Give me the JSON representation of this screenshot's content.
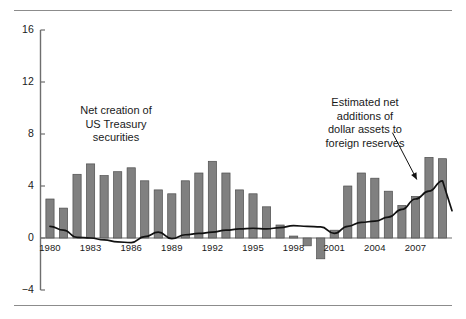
{
  "figure": {
    "background": "#ffffff",
    "rule_color": "#8c8c8c",
    "bar_color": "#808080",
    "bar_edge_color": "#4d4d4d",
    "line_color": "#111111",
    "axis_color": "#6e6e6e"
  },
  "annotations": {
    "left_label": "Net creation of\nUS Treasury\nsecurities",
    "right_label": "Estimated net\nadditions of\ndollar assets to\nforeign reserves"
  },
  "chart_data": {
    "type": "bar",
    "title": "",
    "subtitle": "",
    "xlabel": "",
    "ylabel": "",
    "xlim": [
      1979.3,
      2009.7
    ],
    "ylim": [
      -4,
      16
    ],
    "yticks": [
      -4,
      0,
      4,
      8,
      12,
      16
    ],
    "ytick_labels": [
      "−4",
      "0",
      "4",
      "8",
      "12",
      "16"
    ],
    "grid": false,
    "legend_position": "none",
    "x": [
      1980,
      1981,
      1982,
      1983,
      1984,
      1985,
      1986,
      1987,
      1988,
      1989,
      1990,
      1991,
      1992,
      1993,
      1994,
      1995,
      1996,
      1997,
      1998,
      1999,
      2000,
      2001,
      2002,
      2003,
      2004,
      2005,
      2006,
      2007,
      2008,
      2009
    ],
    "xtick_values": [
      1980,
      1983,
      1986,
      1989,
      1992,
      1995,
      1998,
      2001,
      2004,
      2007
    ],
    "xtick_labels": [
      "1980",
      "1983",
      "1986",
      "1989",
      "1992",
      "1995",
      "1998",
      "2001",
      "2004",
      "2007"
    ],
    "series": [
      {
        "name": "Net creation of US Treasury securities",
        "type": "bar",
        "color": "#808080",
        "values": [
          3.0,
          2.3,
          4.9,
          5.7,
          4.8,
          5.1,
          5.4,
          4.4,
          3.7,
          3.4,
          4.4,
          5.0,
          5.9,
          5.0,
          3.7,
          3.4,
          2.4,
          1.0,
          0.15,
          -0.6,
          -1.6,
          0.6,
          4.0,
          5.0,
          4.6,
          3.6,
          2.5,
          3.2,
          6.2,
          6.1
        ]
      },
      {
        "name": "Estimated net additions of dollar assets to foreign reserves",
        "type": "line",
        "color": "#111111",
        "values": [
          0.9,
          0.6,
          0.05,
          0.0,
          -0.15,
          -0.3,
          -0.35,
          0.1,
          0.45,
          -0.05,
          0.25,
          0.35,
          0.45,
          0.6,
          0.7,
          0.75,
          0.7,
          0.8,
          0.95,
          0.9,
          0.85,
          0.35,
          0.9,
          1.2,
          1.3,
          1.6,
          2.2,
          3.0,
          3.6,
          4.4
        ]
      }
    ],
    "arrow": {
      "from": [
        2005.3,
        8.1
      ],
      "to": [
        2007.1,
        4.5
      ],
      "head": "triangle"
    }
  }
}
